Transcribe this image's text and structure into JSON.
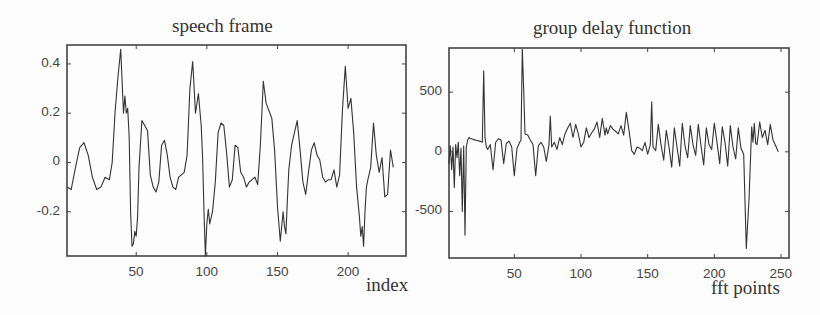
{
  "chart_data": [
    {
      "type": "line",
      "title": "speech frame",
      "xlabel": "index",
      "ylabel": "",
      "xlim": [
        1,
        241
      ],
      "ylim": [
        -0.38,
        0.477
      ],
      "xticks": [
        50,
        100,
        150,
        200
      ],
      "xtick_labels": [
        "50",
        "100",
        "150",
        "200"
      ],
      "yticks": [
        0.4,
        0.2,
        0,
        -0.2
      ],
      "ytick_labels": [
        "0.4",
        "0.2",
        "0",
        "-0.2"
      ],
      "grid": false,
      "legend": null,
      "series": [
        {
          "name": "speech frame",
          "x": [
            1,
            4,
            7,
            10,
            13,
            16,
            19,
            22,
            25,
            28,
            31,
            33,
            35,
            37,
            39,
            41,
            42,
            43,
            44,
            45,
            46,
            47,
            48,
            49,
            50,
            51,
            52,
            54,
            56,
            58,
            60,
            62,
            64,
            66,
            68,
            70,
            72,
            74,
            76,
            78,
            80,
            82,
            84,
            86,
            88,
            90,
            92,
            94,
            96,
            97,
            98,
            99,
            100,
            101,
            102,
            104,
            106,
            108,
            110,
            112,
            114,
            116,
            118,
            120,
            122,
            124,
            126,
            128,
            130,
            132,
            134,
            136,
            138,
            140,
            142,
            144,
            146,
            148,
            150,
            152,
            154,
            155,
            156,
            157,
            158,
            160,
            162,
            164,
            166,
            168,
            170,
            172,
            174,
            176,
            178,
            180,
            182,
            184,
            186,
            188,
            190,
            192,
            194,
            196,
            198,
            200,
            202,
            204,
            206,
            208,
            209,
            210,
            211,
            212,
            213,
            214,
            216,
            218,
            220,
            222,
            224,
            226,
            228,
            230,
            232,
            234,
            236,
            238,
            240,
            241
          ],
          "y": [
            -0.1,
            -0.11,
            -0.02,
            0.06,
            0.08,
            0.03,
            -0.06,
            -0.11,
            -0.1,
            -0.06,
            -0.07,
            0.0,
            0.2,
            0.34,
            0.46,
            0.2,
            0.27,
            0.2,
            0.22,
            0.1,
            -0.2,
            -0.34,
            -0.33,
            -0.28,
            -0.3,
            -0.22,
            -0.02,
            0.17,
            0.15,
            0.13,
            -0.05,
            -0.1,
            -0.12,
            -0.08,
            0.07,
            0.09,
            0.03,
            -0.06,
            -0.1,
            -0.11,
            -0.06,
            -0.05,
            -0.04,
            0.03,
            0.3,
            0.41,
            0.2,
            0.28,
            0.15,
            0.02,
            -0.2,
            -0.38,
            -0.25,
            -0.19,
            -0.25,
            -0.2,
            -0.08,
            0.12,
            0.16,
            0.15,
            0.04,
            -0.1,
            -0.07,
            0.07,
            0.06,
            -0.04,
            -0.06,
            -0.1,
            -0.08,
            -0.07,
            -0.06,
            -0.09,
            0.08,
            0.33,
            0.24,
            0.21,
            0.18,
            0.05,
            -0.18,
            -0.32,
            -0.2,
            -0.26,
            -0.29,
            -0.15,
            -0.03,
            0.07,
            0.12,
            0.17,
            0.05,
            -0.08,
            -0.13,
            -0.04,
            0.05,
            0.08,
            0.03,
            0.01,
            -0.06,
            -0.08,
            -0.07,
            -0.07,
            -0.03,
            -0.1,
            -0.05,
            0.21,
            0.39,
            0.22,
            0.26,
            0.12,
            -0.1,
            -0.22,
            -0.3,
            -0.26,
            -0.34,
            -0.2,
            -0.1,
            -0.07,
            -0.02,
            0.16,
            0.03,
            -0.04,
            0.02,
            -0.14,
            -0.13,
            0.05,
            -0.02
          ]
        }
      ]
    },
    {
      "type": "line",
      "title": "group delay function",
      "xlabel": "fft points",
      "ylabel": "",
      "xlim": [
        1,
        256
      ],
      "ylim": [
        -890,
        870
      ],
      "xticks": [
        50,
        100,
        150,
        200,
        250
      ],
      "xtick_labels": [
        "50",
        "100",
        "150",
        "200",
        "250"
      ],
      "yticks": [
        500,
        0,
        -500
      ],
      "ytick_labels": [
        "500",
        "0",
        "-500"
      ],
      "grid": false,
      "legend": null,
      "series": [
        {
          "name": "group delay",
          "x": [
            1,
            2,
            3,
            4,
            5,
            6,
            7,
            8,
            9,
            10,
            11,
            12,
            13,
            14,
            15,
            16,
            17,
            18,
            20,
            22,
            24,
            26,
            27,
            28,
            29,
            30,
            32,
            34,
            36,
            38,
            40,
            42,
            44,
            46,
            48,
            50,
            52,
            54,
            55,
            56,
            57,
            58,
            60,
            62,
            64,
            66,
            68,
            70,
            72,
            74,
            76,
            77,
            78,
            80,
            82,
            84,
            86,
            88,
            90,
            92,
            94,
            96,
            98,
            100,
            102,
            104,
            106,
            108,
            110,
            112,
            114,
            116,
            118,
            119,
            120,
            122,
            124,
            126,
            128,
            130,
            132,
            134,
            136,
            138,
            140,
            142,
            144,
            146,
            148,
            150,
            152,
            153,
            154,
            156,
            158,
            160,
            162,
            164,
            166,
            168,
            170,
            172,
            174,
            176,
            178,
            180,
            182,
            184,
            186,
            188,
            190,
            192,
            194,
            196,
            198,
            200,
            202,
            204,
            206,
            208,
            210,
            212,
            214,
            216,
            218,
            220,
            222,
            224,
            226,
            228,
            229,
            230,
            231,
            232,
            234,
            236,
            238,
            240,
            242,
            244,
            246,
            248,
            250,
            252,
            254,
            256
          ],
          "y": [
            -100,
            50,
            -150,
            40,
            -300,
            60,
            -50,
            80,
            -200,
            30,
            -500,
            50,
            -700,
            40,
            100,
            120,
            110,
            110,
            100,
            95,
            90,
            80,
            680,
            120,
            40,
            20,
            60,
            -150,
            80,
            110,
            100,
            -100,
            70,
            90,
            40,
            -200,
            30,
            80,
            100,
            860,
            520,
            150,
            140,
            100,
            60,
            -200,
            50,
            80,
            40,
            -80,
            60,
            300,
            40,
            80,
            20,
            120,
            60,
            150,
            200,
            240,
            120,
            230,
            150,
            40,
            80,
            200,
            120,
            160,
            190,
            250,
            120,
            280,
            140,
            200,
            150,
            220,
            190,
            170,
            150,
            220,
            140,
            330,
            180,
            10,
            -20,
            40,
            30,
            10,
            80,
            -20,
            60,
            420,
            40,
            10,
            230,
            60,
            -70,
            180,
            40,
            -130,
            200,
            40,
            -120,
            240,
            50,
            -50,
            220,
            60,
            -30,
            230,
            50,
            -110,
            200,
            60,
            20,
            240,
            80,
            -100,
            210,
            80,
            -120,
            220,
            40,
            -60,
            200,
            30,
            -20,
            -810,
            -400,
            210,
            80,
            240,
            70,
            60,
            250,
            120,
            180,
            60,
            230,
            100,
            50,
            0
          ]
        }
      ]
    }
  ],
  "plots": {
    "left": {
      "title": "speech frame",
      "xlabel": "index"
    },
    "right": {
      "title": "group delay function",
      "xlabel": "fft points"
    }
  },
  "colors": {
    "line": "#333333",
    "axis": "#444444",
    "background": "#fdfdfd"
  }
}
